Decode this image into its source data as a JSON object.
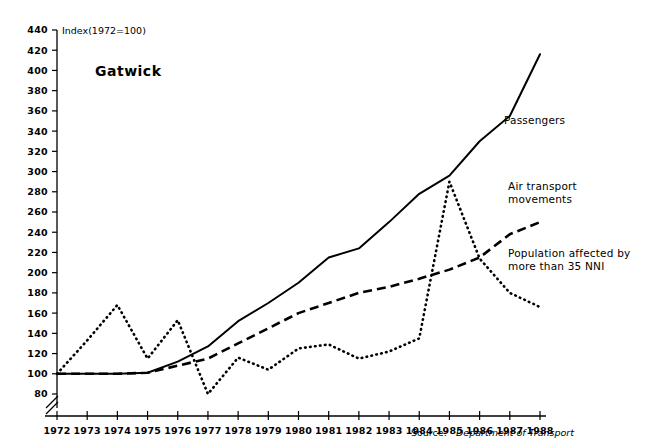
{
  "chart_data": {
    "type": "line",
    "title": "Gatwick",
    "axis_note": "Index(1972=100)",
    "xlabel": "",
    "ylabel": "",
    "x": [
      1972,
      1973,
      1974,
      1975,
      1976,
      1977,
      1978,
      1979,
      1980,
      1981,
      1982,
      1983,
      1984,
      1985,
      1986,
      1987,
      1988
    ],
    "categories": [
      "1972",
      "1973",
      "1974",
      "1975",
      "1976",
      "1977",
      "1978",
      "1979",
      "1980",
      "1981",
      "1982",
      "1983",
      "1984",
      "1985",
      "1986",
      "1987",
      "1988"
    ],
    "xlim": [
      1972,
      1988
    ],
    "ylim": [
      80,
      440
    ],
    "ytick_values": [
      80,
      100,
      120,
      140,
      160,
      180,
      200,
      220,
      240,
      260,
      280,
      300,
      320,
      340,
      360,
      380,
      400,
      420,
      440
    ],
    "ytick_labels": [
      "80",
      "100",
      "120",
      "140",
      "160",
      "180",
      "200",
      "220",
      "240",
      "260",
      "280",
      "300",
      "320",
      "340",
      "360",
      "380",
      "400",
      "420",
      "440"
    ],
    "y_axis_break": true,
    "grid": false,
    "legend_position": "inline-right",
    "series": [
      {
        "name": "Passengers",
        "style": "solid",
        "values": [
          100,
          100,
          100,
          101,
          112,
          127,
          152,
          170,
          190,
          215,
          224,
          250,
          278,
          296,
          330,
          355,
          416
        ]
      },
      {
        "name": "Air transport movements",
        "style": "dashed",
        "values": [
          100,
          100,
          100,
          101,
          108,
          115,
          130,
          145,
          160,
          170,
          180,
          186,
          194,
          203,
          215,
          238,
          250
        ]
      },
      {
        "name": "Population affected by more than 35 NNI",
        "style": "dotted",
        "values": [
          100,
          133,
          168,
          115,
          153,
          80,
          116,
          104,
          125,
          129,
          115,
          122,
          135,
          290,
          214,
          180,
          166
        ]
      }
    ],
    "annotations": [
      {
        "id": "passengers",
        "text": "Passengers"
      },
      {
        "id": "atm",
        "text": "Air transport\nmovements"
      },
      {
        "id": "pop",
        "text": "Population affected by\nmore than 35 NNI"
      }
    ]
  },
  "footer": {
    "source_prefix": "Source:",
    "source_value": "Department of Transport"
  },
  "legend": {
    "passengers": "Passengers",
    "atm_line1": "Air transport",
    "atm_line2": "movements",
    "pop_line1": "Population affected by",
    "pop_line2": "more than 35 NNI"
  },
  "colors": {
    "ink": "#000000",
    "background": "#ffffff"
  }
}
